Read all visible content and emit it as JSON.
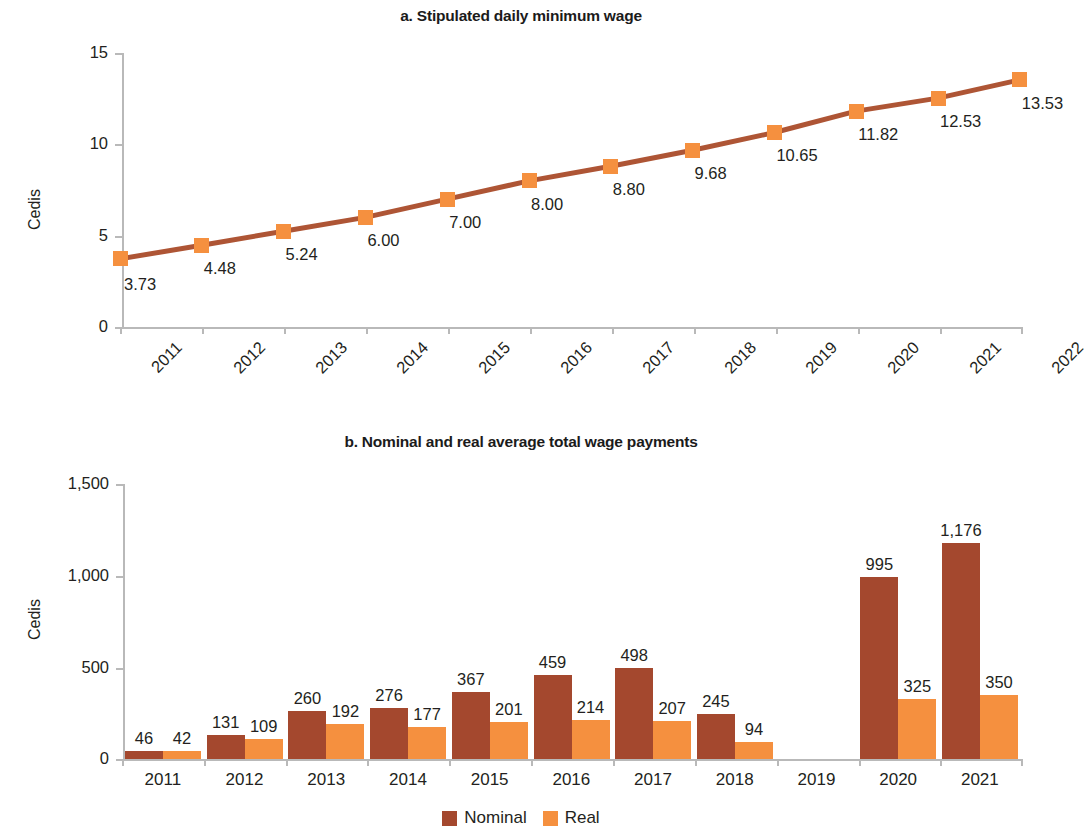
{
  "colors": {
    "nominal": "#A4482E",
    "real": "#F5903F",
    "line": "#AE5535",
    "axis": "#b9b9b9",
    "text": "#231f20",
    "background": "#ffffff"
  },
  "chart_data": [
    {
      "type": "line",
      "panel": "a",
      "title": "a. Stipulated daily minimum wage",
      "xlabel": "",
      "ylabel": "Cedis",
      "ylim": [
        0,
        15
      ],
      "yticks": [
        "0",
        "5",
        "10",
        "15"
      ],
      "ytick_values": [
        0,
        5,
        10,
        15
      ],
      "grid": false,
      "legend": "none",
      "categories": [
        "2011",
        "2012",
        "2013",
        "2014",
        "2015",
        "2016",
        "2017",
        "2018",
        "2019",
        "2020",
        "2021",
        "2022"
      ],
      "values": [
        3.73,
        4.48,
        5.24,
        6.0,
        7.0,
        8.0,
        8.8,
        9.68,
        10.65,
        11.82,
        12.53,
        13.53
      ],
      "point_labels": [
        "3.73",
        "4.48",
        "5.24",
        "6.00",
        "7.00",
        "8.00",
        "8.80",
        "9.68",
        "10.65",
        "11.82",
        "12.53",
        "13.53"
      ],
      "marker": "square",
      "series_name": "Stipulated daily minimum wage"
    },
    {
      "type": "bar",
      "panel": "b",
      "title": "b. Nominal and real average total wage payments",
      "xlabel": "",
      "ylabel": "Cedis",
      "ylim": [
        0,
        1500
      ],
      "yticks": [
        "0",
        "500",
        "1,000",
        "1,500"
      ],
      "ytick_values": [
        0,
        500,
        1000,
        1500
      ],
      "grid": false,
      "legend": "bottom-center",
      "categories": [
        "2011",
        "2012",
        "2013",
        "2014",
        "2015",
        "2016",
        "2017",
        "2018",
        "2019",
        "2020",
        "2021"
      ],
      "series": [
        {
          "name": "Nominal",
          "values": [
            46,
            131,
            260,
            276,
            367,
            459,
            498,
            245,
            null,
            995,
            1176
          ],
          "labels": [
            "46",
            "131",
            "260",
            "276",
            "367",
            "459",
            "498",
            "245",
            "",
            "995",
            "1,176"
          ]
        },
        {
          "name": "Real",
          "values": [
            42,
            109,
            192,
            177,
            201,
            214,
            207,
            94,
            null,
            325,
            350
          ],
          "labels": [
            "42",
            "109",
            "192",
            "177",
            "201",
            "214",
            "207",
            "94",
            "",
            "325",
            "350"
          ]
        }
      ]
    }
  ],
  "panel_a": {
    "title": "a. Stipulated daily minimum wage",
    "ylabel": "Cedis"
  },
  "panel_b": {
    "title": "b. Nominal and real average total wage payments",
    "ylabel": "Cedis",
    "legend": [
      {
        "label": "Nominal",
        "color": "#A4482E"
      },
      {
        "label": "Real",
        "color": "#F5903F"
      }
    ]
  }
}
